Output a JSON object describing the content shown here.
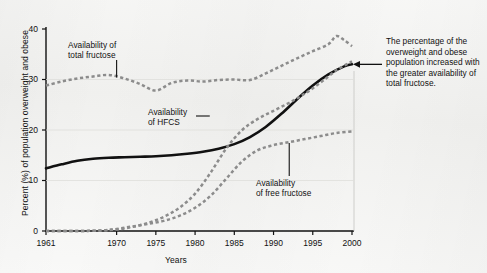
{
  "figure": {
    "background_color": "#f3f3f1",
    "axis_color": "#111111",
    "solid_series_color": "#111111",
    "dashed_series_color": "#8c8c8c"
  },
  "axes": {
    "y_title": "Percent (%) of population overweight and obese",
    "x_title": "Years",
    "y_ticks": [
      "0",
      "10",
      "20",
      "30",
      "40"
    ],
    "x_ticks": [
      "1961",
      "1970",
      "1975",
      "1980",
      "1985",
      "1990",
      "1995",
      "2000"
    ]
  },
  "callouts": {
    "total_fructose": "Availability of\ntotal fructose",
    "hfcs": "Availability\nof HFCS",
    "free_fructose": "Availability\nof free fructose"
  },
  "side_note": "The percentage of the overweight and obese population increased with the greater availability of total fructose.",
  "chart_data": {
    "type": "line",
    "title": "",
    "xlabel": "Years",
    "ylabel": "Percent (%) of population overweight and obese",
    "xlim": [
      1961,
      2000
    ],
    "ylim": [
      0,
      40
    ],
    "xticks": [
      1961,
      1970,
      1975,
      1980,
      1985,
      1990,
      1995,
      2000
    ],
    "yticks": [
      0,
      10,
      20,
      30,
      40
    ],
    "grid": false,
    "legend": "none (inline callout labels with leader lines)",
    "series": [
      {
        "name": "Percent of population overweight and obese",
        "style": "solid",
        "color": "#111111",
        "label_source": "side_note",
        "x": [
          1961,
          1963,
          1965,
          1967,
          1969,
          1971,
          1973,
          1975,
          1977,
          1979,
          1981,
          1983,
          1985,
          1987,
          1989,
          1991,
          1993,
          1995,
          1997,
          1999,
          2000
        ],
        "values": [
          12.4,
          13.2,
          13.9,
          14.3,
          14.5,
          14.6,
          14.7,
          14.8,
          15.0,
          15.3,
          15.7,
          16.3,
          17.2,
          18.6,
          20.6,
          23.2,
          26.1,
          28.8,
          31.0,
          32.6,
          33.0
        ]
      },
      {
        "name": "Availability of total fructose",
        "style": "dashed",
        "color": "#8c8c8c",
        "x": [
          1961,
          1963,
          1965,
          1967,
          1969,
          1971,
          1973,
          1975,
          1977,
          1979,
          1981,
          1983,
          1985,
          1987,
          1989,
          1991,
          1993,
          1995,
          1997,
          1998,
          1999,
          2000
        ],
        "values": [
          28.8,
          29.6,
          30.2,
          30.6,
          30.9,
          30.2,
          29.1,
          27.8,
          29.3,
          29.8,
          29.6,
          29.9,
          30.0,
          29.9,
          31.2,
          32.7,
          34.2,
          35.6,
          37.0,
          38.6,
          37.8,
          36.6
        ]
      },
      {
        "name": "Availability of HFCS",
        "style": "dashed",
        "color": "#8c8c8c",
        "x": [
          1961,
          1965,
          1968,
          1970,
          1972,
          1974,
          1976,
          1978,
          1980,
          1982,
          1984,
          1986,
          1988,
          1990,
          1992,
          1994,
          1996,
          1998,
          2000
        ],
        "values": [
          0.0,
          0.0,
          0.1,
          0.3,
          0.8,
          1.6,
          2.8,
          4.6,
          7.4,
          11.6,
          16.4,
          20.0,
          22.2,
          23.8,
          25.4,
          27.2,
          29.4,
          31.8,
          33.6
        ]
      },
      {
        "name": "Availability of free fructose",
        "style": "dashed",
        "color": "#8c8c8c",
        "x": [
          1961,
          1965,
          1968,
          1970,
          1972,
          1974,
          1976,
          1978,
          1980,
          1982,
          1984,
          1986,
          1988,
          1990,
          1992,
          1994,
          1996,
          1998,
          2000
        ],
        "values": [
          0.0,
          0.0,
          0.1,
          0.4,
          0.9,
          1.4,
          2.0,
          3.0,
          4.6,
          7.0,
          10.4,
          13.8,
          16.0,
          17.0,
          17.6,
          18.2,
          18.8,
          19.4,
          19.7
        ]
      }
    ],
    "annotations": [
      {
        "text": "Availability of total fructose",
        "target_series": "Availability of total fructose",
        "target_x": 1970
      },
      {
        "text": "Availability of HFCS",
        "target_series": "Availability of HFCS",
        "target_x": 1982
      },
      {
        "text": "Availability of free fructose",
        "target_series": "Availability of free fructose",
        "target_x": 1992
      },
      {
        "text": "The percentage of the overweight and obese population increased with the greater availability of total fructose.",
        "target_series": "Percent of population overweight and obese",
        "target_x": 2000
      }
    ]
  }
}
